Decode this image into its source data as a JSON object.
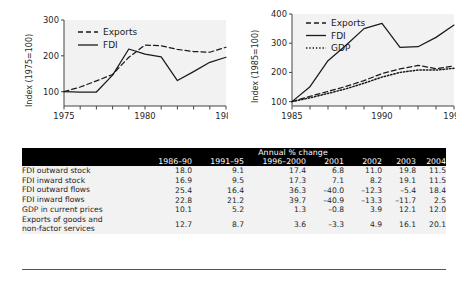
{
  "chart_data": [
    {
      "id": "left",
      "type": "line",
      "title": "",
      "xlabel": "",
      "ylabel": "Index (1975=100)",
      "xlim": [
        1975,
        1985
      ],
      "ylim": [
        60,
        300
      ],
      "yticks": [
        100,
        200,
        300
      ],
      "xticks": [
        1975,
        1980,
        1985
      ],
      "xtick_labels": [
        "1975",
        "1980",
        "1985"
      ],
      "minor_xticks": [
        1976,
        1977,
        1978,
        1979,
        1981,
        1982,
        1983,
        1984
      ],
      "grid": false,
      "legend_position": "top-left",
      "x": [
        1975,
        1976,
        1977,
        1978,
        1979,
        1980,
        1981,
        1982,
        1983,
        1984,
        1985
      ],
      "series": [
        {
          "name": "Exports",
          "style": "dashed",
          "values": [
            100,
            113,
            130,
            148,
            196,
            230,
            228,
            218,
            212,
            210,
            224
          ]
        },
        {
          "name": "FDI",
          "style": "solid",
          "values": [
            100,
            99,
            99,
            146,
            219,
            205,
            197,
            131,
            156,
            182,
            196
          ]
        }
      ]
    },
    {
      "id": "right",
      "type": "line",
      "title": "",
      "xlabel": "",
      "ylabel": "Index (1985=100)",
      "xlim": [
        1985,
        1994
      ],
      "ylim": [
        85,
        400
      ],
      "yticks": [
        100,
        200,
        300,
        400
      ],
      "xticks": [
        1985,
        1990,
        1994
      ],
      "xtick_labels": [
        "1985",
        "1990",
        "1994"
      ],
      "minor_xticks": [
        1986,
        1987,
        1988,
        1989,
        1991,
        1992,
        1993
      ],
      "grid": false,
      "legend_position": "top-left",
      "x": [
        1985,
        1986,
        1987,
        1988,
        1989,
        1990,
        1991,
        1992,
        1993,
        1994
      ],
      "series": [
        {
          "name": "Exports",
          "style": "dashed",
          "values": [
            100,
            118,
            135,
            152,
            172,
            196,
            212,
            224,
            213,
            222
          ]
        },
        {
          "name": "FDI",
          "style": "solid",
          "values": [
            100,
            151,
            240,
            293,
            350,
            368,
            286,
            288,
            320,
            362
          ]
        },
        {
          "name": "GDP",
          "style": "dotted",
          "values": [
            100,
            113,
            128,
            144,
            163,
            184,
            200,
            208,
            208,
            214
          ]
        }
      ]
    }
  ],
  "table": {
    "span_header": "Annual % change",
    "columns": [
      "1986–90",
      "1991–95",
      "1996–2000",
      "2001",
      "2002",
      "2003",
      "2004"
    ],
    "rows": [
      {
        "label": "FDI outward stock",
        "values": [
          "18.0",
          "9.1",
          "17.4",
          "6.8",
          "11.0",
          "19.8",
          "11.5"
        ]
      },
      {
        "label": "FDI inward stock",
        "values": [
          "16.9",
          "9.5",
          "17.3",
          "7.1",
          "8.2",
          "19.1",
          "11.5"
        ]
      },
      {
        "label": "FDI outward flows",
        "values": [
          "25.4",
          "16.4",
          "36.3",
          "–40.0",
          "–12.3",
          "–5.4",
          "18.4"
        ]
      },
      {
        "label": "FDI inward flows",
        "values": [
          "22.8",
          "21.2",
          "39.7",
          "–40.9",
          "–13.3",
          "–11.7",
          "2.5"
        ]
      },
      {
        "label": "GDP in current prices",
        "values": [
          "10.1",
          "5.2",
          "1.3",
          "–0.8",
          "3.9",
          "12.1",
          "12.0"
        ]
      },
      {
        "label": "Exports of goods and\n non-factor services",
        "values": [
          "12.7",
          "8.7",
          "3.6",
          "–3.3",
          "4.9",
          "16.1",
          "20.1"
        ]
      }
    ]
  },
  "colors": {
    "plot_background": "#f2f2f2",
    "line": "#1a1a1a",
    "axis": "#444444",
    "table_header_bg": "#000000",
    "table_header_fg": "#ffffff",
    "table_body_bg": "#f2f2f2"
  }
}
